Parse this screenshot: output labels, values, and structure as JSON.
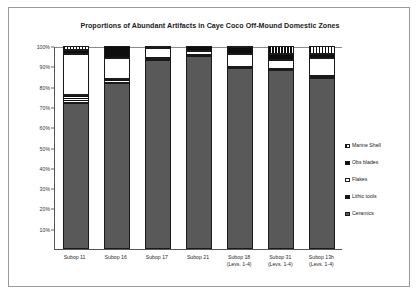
{
  "figure": {
    "title": "Proportions of Abundant Artifacts in Caye Coco Off-Mound Domestic Zones"
  },
  "legend": {
    "position": "right",
    "items": [
      {
        "label": "Marine Shell",
        "swatch": "vertical-hatch-icon"
      },
      {
        "label": "Obs blades",
        "swatch": "solid-black-icon"
      },
      {
        "label": "Flakes",
        "swatch": "white-empty-icon"
      },
      {
        "label": "Lithic  tools",
        "swatch": "horizontal-hatch-icon"
      },
      {
        "label": "Ceramics",
        "swatch": "solid-gray-icon"
      }
    ]
  },
  "yaxis": {
    "ticks": [
      "100%",
      "90%",
      "80%",
      "70%",
      "60%",
      "50%",
      "40%",
      "30%",
      "20%",
      "10%"
    ],
    "values": [
      100,
      90,
      80,
      70,
      60,
      50,
      40,
      30,
      20,
      10
    ]
  },
  "xaxis": {
    "labels": [
      {
        "line1": "Subop 11",
        "line2": ""
      },
      {
        "line1": "Subop 16",
        "line2": ""
      },
      {
        "line1": "Subop 17",
        "line2": ""
      },
      {
        "line1": "Subop 21",
        "line2": ""
      },
      {
        "line1": "Subop 18",
        "line2": "(Levs. 1-4)"
      },
      {
        "line1": "Subop 31",
        "line2": "(Levs. 1-4)"
      },
      {
        "line1": "Subop 13h",
        "line2": "(Levs. 1-4)"
      }
    ]
  },
  "chart_data": {
    "type": "bar",
    "stacked": true,
    "normalized": "100%",
    "title": "Proportions of Abundant Artifacts in Caye Coco Off-Mound Domestic Zones",
    "xlabel": "",
    "ylabel": "",
    "ylim": [
      0,
      100
    ],
    "grid": false,
    "legend_position": "right",
    "categories": [
      "Subop 11",
      "Subop 16",
      "Subop 17",
      "Subop 21",
      "Subop 18 (Levs. 1-4)",
      "Subop 31 (Levs. 1-4)",
      "Subop 13h (Levs. 1-4)"
    ],
    "series": [
      {
        "name": "Ceramics",
        "values": [
          72,
          82,
          93,
          95,
          89,
          88,
          84
        ]
      },
      {
        "name": "Lithic  tools",
        "values": [
          4,
          1.5,
          1,
          0.5,
          0.5,
          0.5,
          1
        ]
      },
      {
        "name": "Flakes",
        "values": [
          20,
          10.5,
          5,
          2,
          6.5,
          4.5,
          9
        ]
      },
      {
        "name": "Obs blades",
        "values": [
          2,
          6,
          0.5,
          2.5,
          3.5,
          3,
          2
        ]
      },
      {
        "name": "Marine Shell",
        "values": [
          2,
          0,
          0.5,
          0,
          0.5,
          4,
          4
        ]
      }
    ]
  }
}
